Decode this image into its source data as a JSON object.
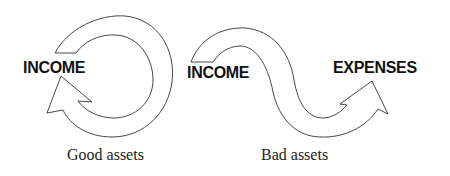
{
  "diagram": {
    "good_assets": {
      "label": "INCOME",
      "caption": "Good assets",
      "shape": "circular-arrow"
    },
    "bad_assets": {
      "source_label": "INCOME",
      "target_label": "EXPENSES",
      "caption": "Bad assets",
      "shape": "s-curve-arrow"
    },
    "colors": {
      "stroke": "#333333",
      "fill": "#ffffff",
      "text": "#111111"
    }
  }
}
